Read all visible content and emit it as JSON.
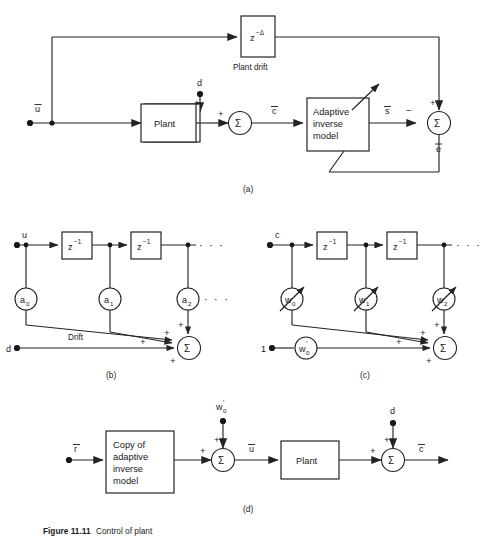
{
  "figure": {
    "caption_bold": "Figure 11.11",
    "caption_rest": "Control of plant",
    "panel_labels": {
      "a": "(a)",
      "b": "(b)",
      "c": "(c)",
      "d": "(d)"
    }
  },
  "panel_a": {
    "label": "(a)",
    "input_label": "u",
    "delay_block": {
      "base": "z",
      "exponent": "−Δ"
    },
    "delay_caption": "Plant drift",
    "disturbance_label": "d",
    "plant_block": "Plant",
    "adaptive_block_lines": [
      "Adaptive",
      "inverse",
      "model"
    ],
    "signal_c": "c",
    "signal_s": "s",
    "signal_e": "e",
    "sum_symbol": "Σ",
    "signs": {
      "plus": "+",
      "minus": "−"
    },
    "summer1_signs": [
      "+",
      "+"
    ],
    "summer2_signs": [
      "+",
      "−"
    ]
  },
  "panel_b": {
    "label": "(b)",
    "input_label": "u",
    "drift_input_label": "d",
    "drift_text": "Drift",
    "delay_block": {
      "base": "z",
      "exponent": "−1"
    },
    "delay_count": 2,
    "gains": [
      {
        "base": "a",
        "sub": "0"
      },
      {
        "base": "a",
        "sub": "1"
      },
      {
        "base": "a",
        "sub": "2"
      }
    ],
    "ellipsis": "· · ·",
    "sum_symbol": "Σ",
    "summer_signs": [
      "+",
      "+",
      "+"
    ]
  },
  "panel_c": {
    "label": "(c)",
    "input_label": "c",
    "bias_input_label": "1",
    "delay_block": {
      "base": "z",
      "exponent": "−1"
    },
    "delay_count": 2,
    "weights": [
      {
        "base": "w",
        "sub": "0",
        "prime": ""
      },
      {
        "base": "w",
        "sub": "1",
        "prime": ""
      },
      {
        "base": "w",
        "sub": "2",
        "prime": ""
      }
    ],
    "bias_weight": {
      "base": "w",
      "sub": "0",
      "prime": "′"
    },
    "ellipsis": "· · ·",
    "sum_symbol": "Σ",
    "summer_signs": [
      "+",
      "+",
      "+"
    ]
  },
  "panel_d": {
    "label": "(d)",
    "input_label": "r",
    "copy_block_lines": [
      "Copy of",
      "adaptive",
      "inverse",
      "model"
    ],
    "bias_label": {
      "base": "w",
      "sub": "0",
      "prime": "′"
    },
    "signal_u": "u",
    "plant_block": "Plant",
    "disturbance_label": "d",
    "output_c": "c",
    "sum_symbol": "Σ",
    "summer1_signs": [
      "+",
      "+"
    ],
    "summer2_signs": [
      "+",
      "+"
    ]
  },
  "colors": {
    "ink": "#232323",
    "paper": "#ffffff"
  }
}
